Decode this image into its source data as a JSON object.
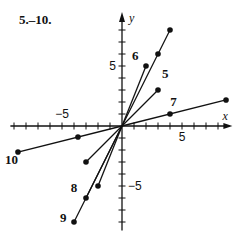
{
  "title": "5.–10.",
  "axes": {
    "x_label": "x",
    "y_label": "y",
    "x_tick_labels": [
      {
        "value": -5,
        "text": "−5"
      },
      {
        "value": 5,
        "text": "5"
      }
    ],
    "y_tick_labels": [
      {
        "value": 5,
        "text": "5"
      },
      {
        "value": -5,
        "text": "−5"
      }
    ],
    "x_ticks": [
      -9,
      -8,
      -7,
      -6,
      -5,
      -4,
      -3,
      -2,
      -1,
      1,
      2,
      3,
      4,
      5,
      6,
      7,
      8
    ],
    "y_ticks": [
      -8,
      -7,
      -6,
      -5,
      -4,
      -3,
      -2,
      -1,
      1,
      2,
      3,
      4,
      5,
      6,
      7,
      8
    ],
    "xlim": [
      -9.3,
      9.2
    ],
    "ylim": [
      -8.7,
      9.5
    ],
    "origin_px": [
      122,
      126
    ],
    "unit_px": 12
  },
  "vectors": [
    {
      "label": "5",
      "points": [
        [
          0,
          0
        ],
        [
          3,
          3
        ]
      ],
      "label_pos": [
        3.6,
        4.0
      ]
    },
    {
      "label": "5",
      "points": [
        [
          0,
          0
        ],
        [
          -3,
          -3
        ]
      ],
      "label_pos": null
    },
    {
      "label": "6",
      "points": [
        [
          0,
          0
        ],
        [
          2,
          5
        ]
      ],
      "label_pos": [
        1.1,
        5.5
      ]
    },
    {
      "label": "6",
      "points": [
        [
          0,
          0
        ],
        [
          -2,
          -5
        ]
      ],
      "label_pos": null
    },
    {
      "label": "",
      "points": [
        [
          0,
          0
        ],
        [
          3,
          6
        ],
        [
          4,
          8
        ]
      ],
      "label_pos": null
    },
    {
      "label": "8",
      "points": [
        [
          0,
          0
        ],
        [
          -3,
          -6
        ]
      ],
      "label_pos": [
        -4.0,
        -5.5
      ]
    },
    {
      "label": "9",
      "points": [
        [
          0,
          0
        ],
        [
          -4,
          -8
        ]
      ],
      "label_pos": [
        -4.9,
        -8.0
      ]
    },
    {
      "label": "7",
      "points": [
        [
          0,
          0
        ],
        [
          4,
          1
        ],
        [
          8.67,
          2.17
        ]
      ],
      "label_pos": [
        4.3,
        1.7
      ]
    },
    {
      "label": "10",
      "points": [
        [
          0,
          0
        ],
        [
          -3.67,
          -0.92
        ],
        [
          -8.67,
          -2.17
        ]
      ],
      "label_pos": [
        -9.2,
        -3.2
      ]
    }
  ],
  "colors": {
    "ink": "#111111",
    "background": "#ffffff"
  }
}
